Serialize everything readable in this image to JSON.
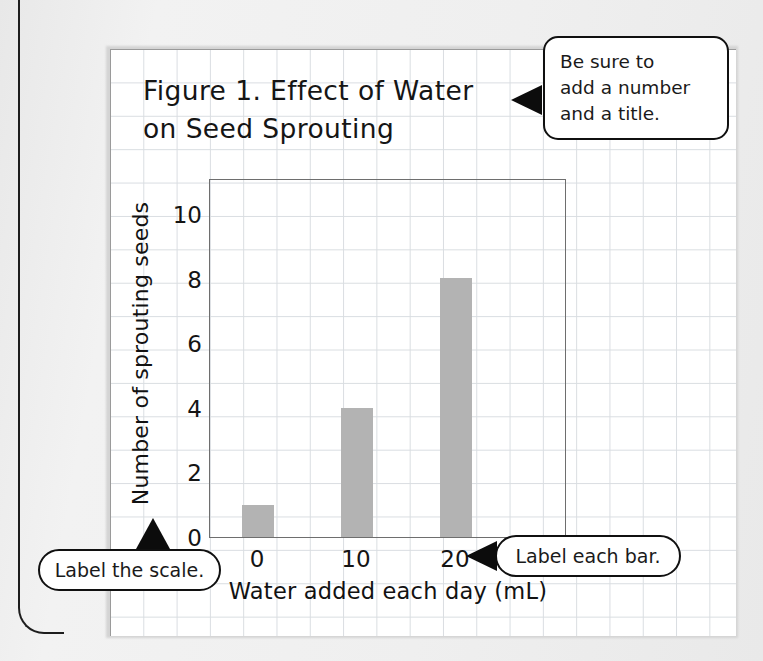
{
  "page": {
    "kind": "worksheet-graph-paper",
    "paper_color": "#ffffff",
    "grid_color": "#d9dde1",
    "background_color": "#efefef"
  },
  "figure": {
    "title": "Figure 1. Effect of Water\non Seed Sprouting"
  },
  "chart_data": {
    "type": "bar",
    "title": "Figure 1. Effect of Water on Seed Sprouting",
    "categories": [
      "0",
      "10",
      "20"
    ],
    "values": [
      1,
      4,
      8
    ],
    "xlabel": "Water added each day (mL)",
    "ylabel": "Number of sprouting seeds",
    "yticks": [
      "0",
      "2",
      "4",
      "6",
      "8",
      "10"
    ],
    "ytick_values": [
      0,
      2,
      4,
      6,
      8,
      10
    ],
    "xticks": [
      "0",
      "10",
      "20"
    ],
    "ylim": [
      0,
      11.1
    ],
    "grid": true,
    "legend": "none",
    "bar_color": "#b3b3b3",
    "axis_color": "#6e6e6e"
  },
  "callouts": {
    "title_note": "Be sure to\nadd a number\nand a title.",
    "scale_note": "Label the scale.",
    "bar_note": "Label each bar."
  }
}
